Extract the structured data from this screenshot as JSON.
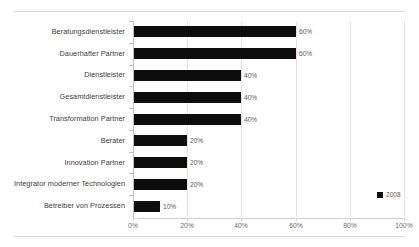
{
  "chart_data": {
    "type": "bar",
    "orientation": "horizontal",
    "title": "",
    "xlabel": "",
    "ylabel": "",
    "xlim": [
      0,
      100
    ],
    "x_tick_labels": [
      "0%",
      "20%",
      "40%",
      "60%",
      "80%",
      "100%"
    ],
    "x_ticks": [
      0,
      20,
      40,
      60,
      80,
      100
    ],
    "grid": true,
    "grid_axis": "x",
    "legend": {
      "position": "bottom-right",
      "entries": [
        {
          "name": "2008",
          "color": "#0d0d0d"
        }
      ]
    },
    "categories": [
      "Beratungsdienstleister",
      "Dauerhafter Partner",
      "Dienstleister",
      "Gesamtdienstleister",
      "Transformation Partner",
      "Berater",
      "Innovation Partner",
      "Integrator moderner Technologien",
      "Betreiber von Prozessen"
    ],
    "series": [
      {
        "name": "2008",
        "color": "#0d0d0d",
        "values": [
          60,
          60,
          40,
          40,
          40,
          20,
          20,
          20,
          10
        ],
        "data_labels": [
          "60%",
          "60%",
          "40%",
          "40%",
          "40%",
          "20%",
          "20%",
          "20%",
          "10%"
        ]
      }
    ]
  },
  "colors": {
    "bar": "#0d0d0d",
    "grid": "#e3e3e3",
    "axis": "#bfbfbf",
    "label_text": "#3b3b3b",
    "value_text": "#5a5a5a",
    "tick_text": "#6b6b6b",
    "page_rule": "#d9d9d9",
    "background": "#ffffff"
  }
}
